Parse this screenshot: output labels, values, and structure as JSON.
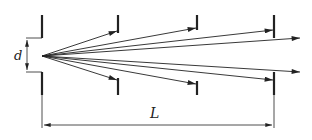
{
  "diagram": {
    "labels": {
      "slit_width": "d",
      "distance": "L"
    },
    "colors": {
      "ink": "#222222",
      "background": "#ffffff"
    },
    "source": {
      "x": 42,
      "y": 56
    },
    "screens": [
      {
        "name": "slit",
        "x": 42,
        "top": [
          15,
          38
        ],
        "bottom": [
          72,
          95
        ]
      },
      {
        "name": "screen-1",
        "x": 118,
        "top": [
          15,
          33
        ],
        "bottom": [
          78,
          95
        ]
      },
      {
        "name": "screen-2",
        "x": 197,
        "top": [
          15,
          30
        ],
        "bottom": [
          81,
          95
        ]
      },
      {
        "name": "screen-3",
        "x": 274,
        "top": [
          15,
          38
        ],
        "bottom": [
          72,
          95
        ]
      }
    ],
    "rays": [
      {
        "to": [
          117,
          31
        ]
      },
      {
        "to": [
          196,
          28
        ]
      },
      {
        "to": [
          273,
          30
        ]
      },
      {
        "to": [
          300,
          38
        ]
      },
      {
        "to": [
          300,
          72
        ]
      },
      {
        "to": [
          273,
          80
        ]
      },
      {
        "to": [
          196,
          84
        ]
      },
      {
        "to": [
          117,
          80
        ]
      }
    ],
    "dimension": {
      "y": 125,
      "from_x": 42,
      "to_x": 274
    }
  }
}
